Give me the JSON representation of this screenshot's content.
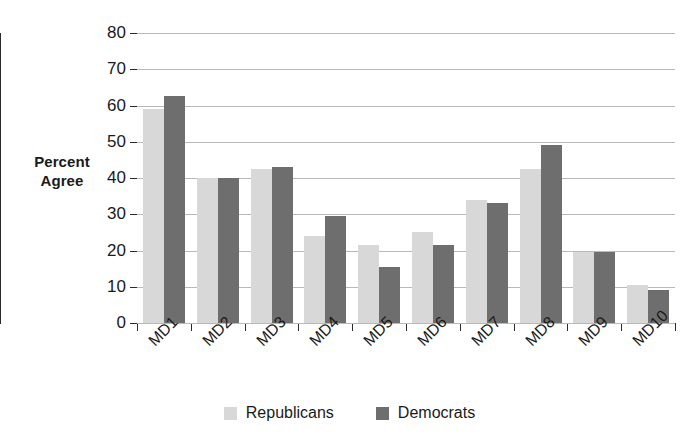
{
  "chart_data": {
    "type": "bar",
    "title": "",
    "subtitle": "",
    "xlabel": "",
    "ylabel": "Percent Agree",
    "ylabel_lines": [
      "Percent",
      "Agree"
    ],
    "ylim": [
      0,
      80
    ],
    "yticks": [
      0,
      10,
      20,
      30,
      40,
      50,
      60,
      70,
      80
    ],
    "ytick_labels": [
      "0",
      "10",
      "20",
      "30",
      "40",
      "50",
      "60",
      "70",
      "80"
    ],
    "grid": true,
    "grid_axis": "y",
    "legend_position": "bottom-center",
    "categories": [
      "MD1",
      "MD2",
      "MD3",
      "MD4",
      "MD5",
      "MD6",
      "MD7",
      "MD8",
      "MD9",
      "MD10"
    ],
    "series": [
      {
        "name": "Republicans",
        "color": "#d8d8d8",
        "values": [
          59,
          40,
          42.5,
          24,
          21.5,
          25,
          34,
          42.5,
          19.5,
          10.5
        ]
      },
      {
        "name": "Democrats",
        "color": "#6e6e6e",
        "values": [
          62.5,
          40,
          43,
          29.5,
          15.5,
          21.5,
          33,
          49,
          19.5,
          9
        ]
      }
    ],
    "legend": [
      {
        "label": "Republicans",
        "color": "#d8d8d8"
      },
      {
        "label": "Democrats",
        "color": "#6e6e6e"
      }
    ],
    "axis_color": "#2b2b2b",
    "grid_color": "#b9b9b9",
    "background": "#ffffff"
  }
}
